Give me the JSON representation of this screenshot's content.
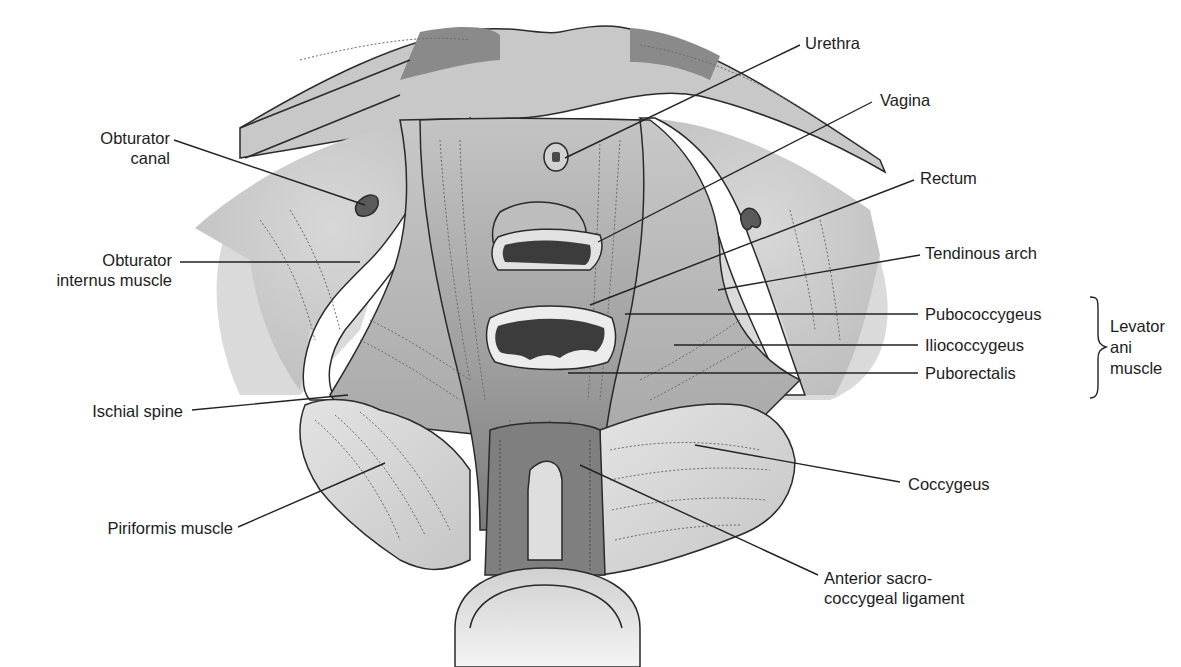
{
  "figure": {
    "background_color": "#ffffff",
    "colors": {
      "muscle_light": "#d9d9d9",
      "muscle_mid": "#bdbdbd",
      "muscle_dark": "#8f8f8f",
      "lumen": "#3c3c3c",
      "line": "#222222"
    }
  },
  "labels": {
    "urethra": "Urethra",
    "vagina": "Vagina",
    "rectum": "Rectum",
    "tendinous_arch": "Tendinous arch",
    "pubococcygeus": "Pubococcygeus",
    "iliococcygeus": "Iliococcygeus",
    "puborectalis": "Puborectalis",
    "levator_group": {
      "line1": "Levator",
      "line2": "ani",
      "line3": "muscle"
    },
    "coccygeus": "Coccygeus",
    "anterior_sacro": {
      "line1": "Anterior sacro-",
      "line2": "coccygeal ligament"
    },
    "obturator_canal": {
      "line1": "Obturator",
      "line2": "canal"
    },
    "obturator_internus": {
      "line1": "Obturator",
      "line2": "internus muscle"
    },
    "ischial_spine": "Ischial spine",
    "piriformis": "Piriformis muscle"
  }
}
